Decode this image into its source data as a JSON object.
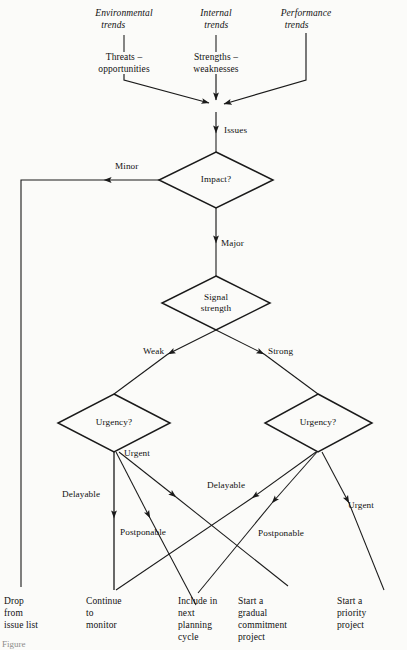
{
  "figure": {
    "type": "flowchart",
    "background_color": "#fbfbf9",
    "line_color": "#1a1a1a",
    "text_color": "#111111"
  },
  "sources": [
    {
      "id": "environmental",
      "line1": "Environmental",
      "line2": "trends",
      "style": "italic"
    },
    {
      "id": "internal",
      "line1": "Internal",
      "line2": "trends",
      "style": "italic"
    },
    {
      "id": "performance",
      "line1": "Performance",
      "line2": "trends",
      "style": "italic"
    }
  ],
  "source_outputs": [
    {
      "id": "threats",
      "line1": "Threats –",
      "line2": "opportunities"
    },
    {
      "id": "strengths",
      "line1": "Strengths –",
      "line2": "weaknesses"
    }
  ],
  "nodes": {
    "issues_label": "Issues",
    "impact": "Impact?",
    "signal_strength_line1": "Signal",
    "signal_strength_line2": "strength",
    "urgency_left": "Urgency?",
    "urgency_right": "Urgency?"
  },
  "edge_labels": {
    "minor": "Minor",
    "major": "Major",
    "weak": "Weak",
    "strong": "Strong",
    "urgent_left": "Urgent",
    "delayable_left": "Delayable",
    "postponable_left": "Postponable",
    "delayable_right": "Delayable",
    "postponable_right": "Postponable",
    "urgent_right": "Urgent"
  },
  "outcomes": [
    {
      "id": "drop",
      "lines": "Drop\nfrom\nissue list"
    },
    {
      "id": "monitor",
      "lines": "Continue\nto\nmonitor"
    },
    {
      "id": "planning",
      "lines": "Include in\nnext\nplanning\ncycle"
    },
    {
      "id": "gradual",
      "lines": "Start a\ngradual\ncommitment\nproject"
    },
    {
      "id": "priority",
      "lines": "Start a\npriority\nproject"
    }
  ],
  "caption": {
    "partial_text": "Figure"
  }
}
